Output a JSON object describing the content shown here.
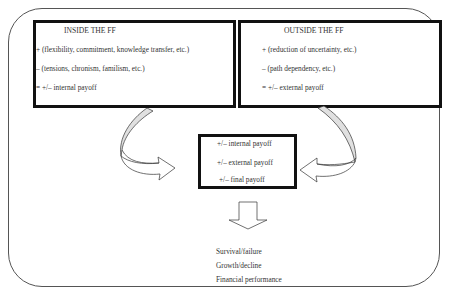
{
  "inside_box": {
    "title": "INSIDE THE FF",
    "lines": [
      "+ (flexibility, commitment, knowledge transfer, etc.)",
      "– (tensions, chronism, familism, etc.)",
      "= +/– internal payoff"
    ]
  },
  "outside_box": {
    "title": "OUTSIDE THE FF",
    "lines": [
      "+ (reduction of uncertainty, etc.)",
      "– (path dependency, etc.)",
      "= +/– external payoff"
    ]
  },
  "center_box": {
    "lines": [
      "+/– internal payoff",
      "+/– external payoff",
      "+/– final payoff"
    ]
  },
  "outcomes": [
    "Survival/failure",
    "Growth/decline",
    "Financial performance"
  ],
  "colors": {
    "arrow_fill": "#e0e0e0",
    "border": "#111111",
    "frame": "#555555"
  }
}
